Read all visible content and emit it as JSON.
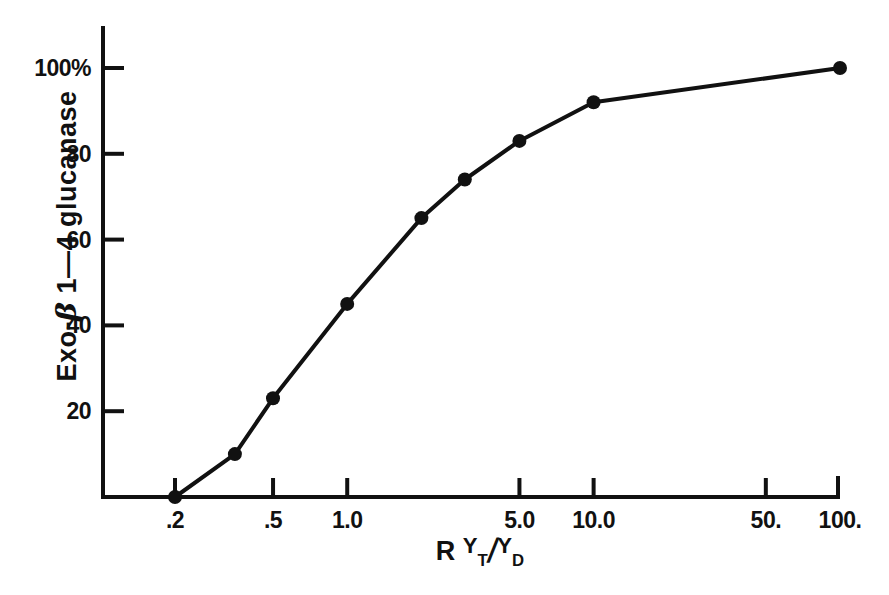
{
  "chart_data": {
    "type": "line",
    "title": "",
    "xlabel": "R YT/YD",
    "ylabel": "Exo-β 1—4 glucanase",
    "xscale": "log",
    "yscale": "linear",
    "xlim": [
      0.15,
      130
    ],
    "ylim": [
      0,
      105
    ],
    "grid": false,
    "legend": null,
    "marker": "filled-circle",
    "x": [
      0.2,
      0.35,
      0.5,
      1.0,
      2.0,
      3.0,
      5.0,
      10.0,
      100.0
    ],
    "values": [
      0,
      10,
      23,
      45,
      65,
      74,
      83,
      92,
      100
    ],
    "series": [
      {
        "name": "Exo-β 1—4 glucanase",
        "x": [
          0.2,
          0.35,
          0.5,
          1.0,
          2.0,
          3.0,
          5.0,
          10.0,
          100.0
        ],
        "values": [
          0,
          10,
          23,
          45,
          65,
          74,
          83,
          92,
          100
        ]
      }
    ],
    "xticks": [
      0.2,
      0.5,
      1.0,
      5.0,
      10.0,
      50.0,
      100.0
    ],
    "xtick_labels": [
      ".2",
      ".5",
      "1.0",
      "5.0",
      "10.0",
      "50.",
      "100."
    ],
    "yticks": [
      20,
      40,
      60,
      80,
      100
    ],
    "ytick_labels": [
      "20",
      "40",
      "60",
      "80",
      "100%"
    ],
    "line_color": "#111111",
    "marker_color": "#111111",
    "background_color": "#ffffff"
  },
  "axis_titles": {
    "y_prefix": "Exo-",
    "y_beta": "β",
    "y_suffix": " 1—4 glucanase",
    "x_r": "R",
    "x_numerator_var": "Y",
    "x_numerator_sub": "T",
    "x_slash": "/",
    "x_denominator_var": "Y",
    "x_denominator_sub": "D"
  }
}
